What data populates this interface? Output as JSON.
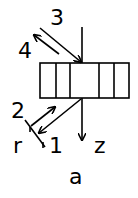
{
  "diagram": {
    "labels": {
      "ray1": "1",
      "ray2": "2",
      "ray3": "3",
      "ray4": "4",
      "axis_r": "r",
      "axis_z": "z",
      "caption": "a"
    },
    "stroke_color": "#000000",
    "background": "#ffffff"
  }
}
